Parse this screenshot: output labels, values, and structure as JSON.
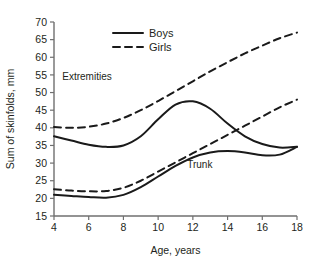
{
  "chart_data": {
    "type": "line",
    "title": "",
    "xlabel": "Age, years",
    "ylabel": "Sum of skinfolds, mm",
    "xlim": [
      4,
      18
    ],
    "ylim": [
      15,
      70
    ],
    "xticks": [
      4,
      6,
      8,
      10,
      12,
      14,
      16,
      18
    ],
    "yticks": [
      15,
      20,
      25,
      30,
      35,
      40,
      45,
      50,
      55,
      60,
      65,
      70
    ],
    "grid": false,
    "legend_position": "top-center",
    "legend": [
      {
        "label": "Boys",
        "style": "solid"
      },
      {
        "label": "Girls",
        "style": "dashed"
      }
    ],
    "annotations": [
      {
        "text": "Extremities",
        "x": 5.9,
        "y": 53.5
      },
      {
        "text": "Trunk",
        "x": 12.4,
        "y": 28.5
      }
    ],
    "series": [
      {
        "name": "Girls, extremities",
        "group": "Girls",
        "region": "Extremities",
        "style": "dashed",
        "x": [
          4,
          5,
          6,
          7,
          8,
          9,
          10,
          11,
          12,
          13,
          14,
          15,
          16,
          17,
          18
        ],
        "values": [
          40.2,
          40.0,
          40.3,
          41.2,
          42.8,
          45.0,
          47.6,
          50.4,
          53.2,
          56.0,
          58.6,
          61.1,
          63.3,
          65.4,
          67.0
        ]
      },
      {
        "name": "Boys, extremities",
        "group": "Boys",
        "region": "Extremities",
        "style": "solid",
        "x": [
          4,
          5,
          6,
          7,
          8,
          9,
          10,
          11,
          12,
          13,
          14,
          15,
          16,
          17,
          18
        ],
        "values": [
          37.6,
          36.4,
          35.2,
          34.6,
          35.0,
          37.6,
          42.4,
          46.6,
          47.5,
          45.4,
          41.2,
          37.6,
          35.4,
          34.4,
          34.6
        ]
      },
      {
        "name": "Girls, trunk",
        "group": "Girls",
        "region": "Trunk",
        "style": "dashed",
        "x": [
          4,
          5,
          6,
          7,
          8,
          9,
          10,
          11,
          12,
          13,
          14,
          15,
          16,
          17,
          18
        ],
        "values": [
          22.6,
          22.2,
          22.0,
          22.1,
          23.0,
          25.0,
          27.6,
          30.2,
          32.8,
          35.4,
          38.0,
          40.6,
          43.2,
          45.8,
          48.0
        ]
      },
      {
        "name": "Boys, trunk",
        "group": "Boys",
        "region": "Trunk",
        "style": "solid",
        "x": [
          4,
          5,
          6,
          7,
          8,
          9,
          10,
          11,
          12,
          13,
          14,
          15,
          16,
          17,
          18
        ],
        "values": [
          21.0,
          20.7,
          20.4,
          20.2,
          21.0,
          23.2,
          26.2,
          29.2,
          31.6,
          33.0,
          33.4,
          33.0,
          32.2,
          32.4,
          34.6
        ]
      }
    ]
  }
}
